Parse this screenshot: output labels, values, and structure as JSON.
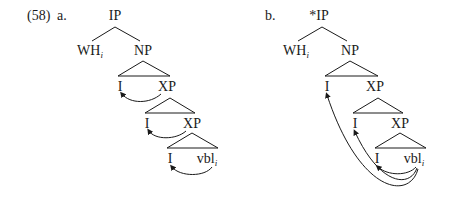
{
  "example_number": "(58)",
  "trees": [
    {
      "label": "a.",
      "root": "IP",
      "root_mark": "",
      "left_daughter": "WH",
      "left_index": "i",
      "right_daughter": "NP",
      "levels": [
        {
          "head": "I",
          "complement": "XP"
        },
        {
          "head": "I",
          "complement": "XP"
        },
        {
          "head": "I",
          "complement": "vbl",
          "complement_index": "i"
        }
      ],
      "arrows": "local: each vbl/XP links to adjacent I"
    },
    {
      "label": "b.",
      "root": "IP",
      "root_mark": "*",
      "left_daughter": "WH",
      "left_index": "i",
      "right_daughter": "NP",
      "levels": [
        {
          "head": "I",
          "complement": "XP"
        },
        {
          "head": "I",
          "complement": "XP"
        },
        {
          "head": "I",
          "complement": "vbl",
          "complement_index": "i"
        }
      ],
      "arrows": "long-distance: vbl links to all three I heads"
    }
  ],
  "colors": {
    "ink": "#1a1a1a",
    "background": "#ffffff"
  }
}
